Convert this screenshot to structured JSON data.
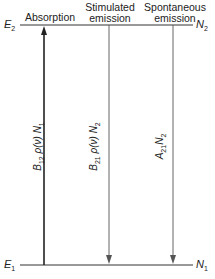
{
  "diagram": {
    "levels": {
      "upper": {
        "energy": "E",
        "energy_sub": "2",
        "population": "N",
        "population_sub": "2"
      },
      "lower": {
        "energy": "E",
        "energy_sub": "1",
        "population": "N",
        "population_sub": "1"
      }
    },
    "processes": [
      {
        "title_line1": "",
        "title_line2": "Absorption",
        "rate": {
          "coef": "B",
          "coef_sub": "12",
          "mid": " ρ(ν) ",
          "pop": "N",
          "pop_sub": "1"
        },
        "direction": "up"
      },
      {
        "title_line1": "Stimulated",
        "title_line2": "emission",
        "rate": {
          "coef": "B",
          "coef_sub": "21",
          "mid": " ρ(ν) ",
          "pop": "N",
          "pop_sub": "2"
        },
        "direction": "down"
      },
      {
        "title_line1": "Spontaneous",
        "title_line2": "emission",
        "rate": {
          "coef": "A",
          "coef_sub": "21",
          "mid": "",
          "pop": "N",
          "pop_sub": "2"
        },
        "direction": "down"
      }
    ],
    "colors": {
      "line": "#333333",
      "text": "#222222"
    }
  }
}
